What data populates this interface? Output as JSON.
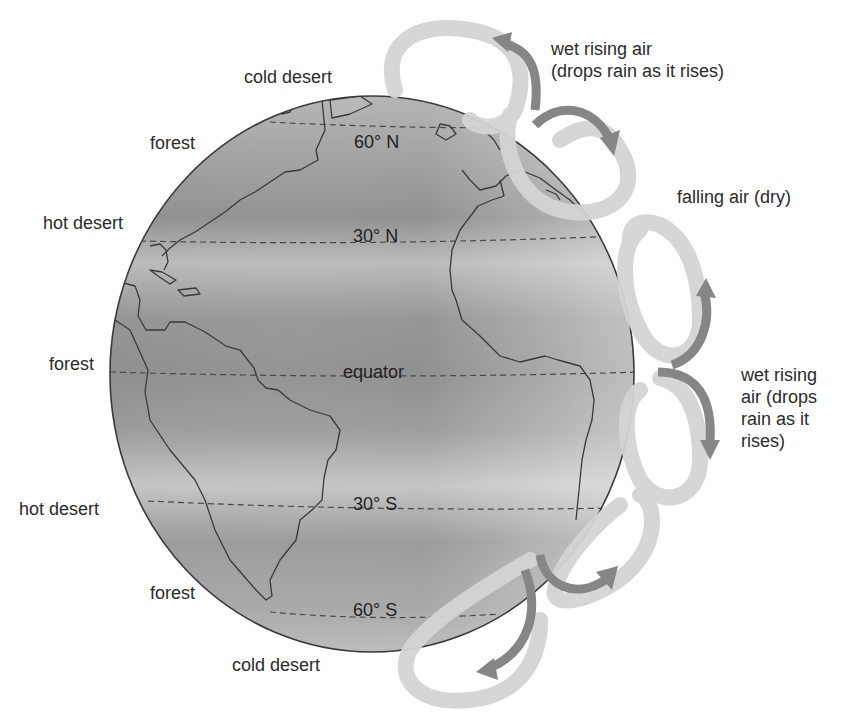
{
  "diagram": {
    "title": "",
    "colors": {
      "globe_dark": "#8f8f8f",
      "globe_light": "#c9c9c9",
      "outline": "#3a3a3a",
      "loop_light": "#d6d6d6",
      "arrow_dark": "#8a8a8a",
      "text": "#2b2b2b"
    },
    "latitude_lines": [
      {
        "label": "60° N",
        "id": "lat-60n"
      },
      {
        "label": "30° N",
        "id": "lat-30n"
      },
      {
        "label": "equator",
        "id": "equator"
      },
      {
        "label": "30° S",
        "id": "lat-30s"
      },
      {
        "label": "60° S",
        "id": "lat-60s"
      }
    ],
    "climate_labels": [
      {
        "text": "cold desert",
        "zone": "north-polar"
      },
      {
        "text": "forest",
        "zone": "north-60"
      },
      {
        "text": "hot desert",
        "zone": "north-30"
      },
      {
        "text": "forest",
        "zone": "equator"
      },
      {
        "text": "hot desert",
        "zone": "south-30"
      },
      {
        "text": "forest",
        "zone": "south-60"
      },
      {
        "text": "cold desert",
        "zone": "south-polar"
      }
    ],
    "air_labels": [
      {
        "text": "wet rising air\n(drops rain as it rises)",
        "position": "upper-right"
      },
      {
        "text": "falling air (dry)",
        "position": "right-30n"
      },
      {
        "text": "wet rising\nair (drops\nrain as it\nrises)",
        "position": "right-equator"
      }
    ]
  }
}
